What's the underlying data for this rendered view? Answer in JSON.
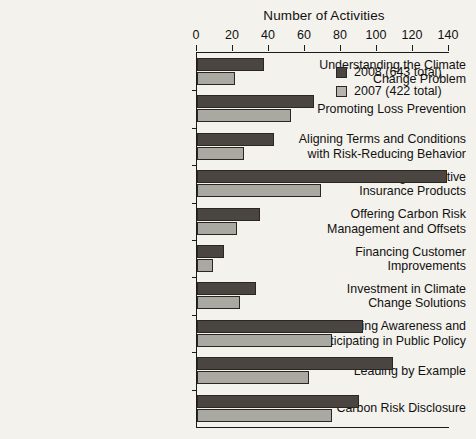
{
  "chart_data": {
    "type": "bar",
    "orientation": "horizontal",
    "title": "Number of Activities",
    "xlabel": "Number of Activities",
    "ylabel": "",
    "xlim": [
      0,
      140
    ],
    "xticks": [
      0,
      20,
      40,
      60,
      80,
      100,
      120,
      140
    ],
    "grid": false,
    "legend_position": "top-right",
    "categories": [
      "Understanding the Climate Change Problem",
      "Promoting Loss Prevention",
      "Aligning Terms and Conditions with Risk-Reducing Behavior",
      "Crafting Innovative Insurance Products",
      "Offering Carbon Risk Management and Offsets",
      "Financing Customer Improvements",
      "Investment in Climate Change Solutions",
      "Building Awareness and Participating in Public Policy",
      "Leading by Example",
      "Carbon Risk Disclosure"
    ],
    "category_lines": [
      [
        "Understanding the Climate",
        "Change Problem"
      ],
      [
        "Promoting Loss Prevention"
      ],
      [
        "Aligning Terms and Conditions",
        "with Risk-Reducing Behavior"
      ],
      [
        "Crafting Innovative",
        "Insurance Products"
      ],
      [
        "Offering Carbon Risk",
        "Management and Offsets"
      ],
      [
        "Financing Customer",
        "Improvements"
      ],
      [
        "Investment in Climate",
        "Change Solutions"
      ],
      [
        "Building Awareness and",
        "Participating in Public Policy"
      ],
      [
        "Leading by Example"
      ],
      [
        "Carbon Risk Disclosure"
      ]
    ],
    "series": [
      {
        "name": "2008 (643 total)",
        "year": "2008",
        "total": 643,
        "color": "#4a4540",
        "values": [
          37,
          65,
          43,
          139,
          35,
          15,
          33,
          92,
          109,
          90
        ]
      },
      {
        "name": "2007 (422 total)",
        "year": "2007",
        "total": 422,
        "color": "#a9a9a1",
        "values": [
          21,
          52,
          26,
          69,
          22,
          9,
          24,
          75,
          62,
          75
        ]
      }
    ]
  },
  "legend": {
    "items": [
      {
        "label": "2008 (643 total)",
        "swatch": "s2008"
      },
      {
        "label": "2007 (422 total)",
        "swatch": "s2007"
      }
    ]
  }
}
